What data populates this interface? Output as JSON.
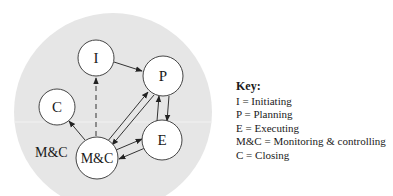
{
  "diagram": {
    "group_label": "M&C",
    "nodes": [
      {
        "id": "I",
        "label": "I",
        "cx": 96,
        "cy": 58,
        "r": 18
      },
      {
        "id": "P",
        "label": "P",
        "cx": 163,
        "cy": 76,
        "r": 20
      },
      {
        "id": "E",
        "label": "E",
        "cx": 162,
        "cy": 140,
        "r": 20
      },
      {
        "id": "MC",
        "label": "M&C",
        "cx": 97,
        "cy": 158,
        "r": 21
      },
      {
        "id": "C",
        "label": "C",
        "cx": 57,
        "cy": 107,
        "r": 18
      }
    ],
    "edges": [
      {
        "from": "I",
        "to": "P",
        "style": "solid"
      },
      {
        "from": "MC",
        "to": "I",
        "style": "dashed"
      },
      {
        "from": "MC",
        "to": "C",
        "style": "solid"
      },
      {
        "from": "MC",
        "to": "P",
        "style": "solid"
      },
      {
        "from": "P",
        "to": "MC",
        "style": "solid"
      },
      {
        "from": "P",
        "to": "E",
        "style": "solid"
      },
      {
        "from": "E",
        "to": "P",
        "style": "solid"
      },
      {
        "from": "MC",
        "to": "E",
        "style": "solid"
      },
      {
        "from": "E",
        "to": "MC",
        "style": "solid"
      }
    ],
    "colors": {
      "background_circle": "#e6e6e6",
      "node_fill": "#ffffff",
      "stroke": "#333333"
    }
  },
  "key": {
    "title": "Key:",
    "items": [
      "I = Initiating",
      "P = Planning",
      "E = Executing",
      "M&C = Monitoring & controlling",
      "C = Closing"
    ]
  }
}
